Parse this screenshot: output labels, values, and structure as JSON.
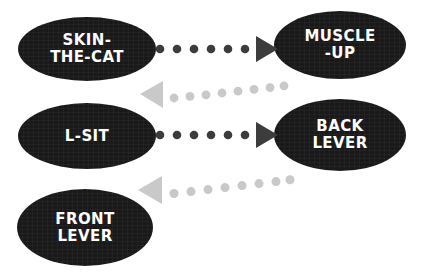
{
  "diagram": {
    "background_color": "#ffffff",
    "node_fill_color": "#191919",
    "node_text_color": "#ffffff",
    "arrow_dark_color": "#3c3c3c",
    "arrow_light_color": "#c9c9c9",
    "nodes": [
      {
        "id": "skin-the-cat",
        "label": "SKIN-\nTHE-CAT",
        "column": "left",
        "row": 1
      },
      {
        "id": "muscle-up",
        "label": "MUSCLE\n-UP",
        "column": "right",
        "row": 1
      },
      {
        "id": "l-sit",
        "label": "L-SIT",
        "column": "left",
        "row": 2
      },
      {
        "id": "back-lever",
        "label": "BACK\nLEVER",
        "column": "right",
        "row": 2
      },
      {
        "id": "front-lever",
        "label": "FRONT\nLEVER",
        "column": "left",
        "row": 3
      }
    ],
    "arrows": [
      {
        "id": "skin-to-muscle",
        "from": "skin-the-cat",
        "to": "muscle-up",
        "direction": "right",
        "style": "dotted",
        "color": "#3c3c3c",
        "dot_count": 6,
        "slope": "horizontal"
      },
      {
        "id": "muscle-to-lsit",
        "from": "muscle-up",
        "to": "l-sit",
        "direction": "left",
        "style": "dotted",
        "color": "#c9c9c9",
        "dot_count": 8,
        "slope": "up-right"
      },
      {
        "id": "lsit-to-back",
        "from": "l-sit",
        "to": "back-lever",
        "direction": "right",
        "style": "dotted",
        "color": "#3c3c3c",
        "dot_count": 6,
        "slope": "horizontal"
      },
      {
        "id": "back-to-front",
        "from": "back-lever",
        "to": "front-lever",
        "direction": "left",
        "style": "dotted",
        "color": "#c9c9c9",
        "dot_count": 8,
        "slope": "up-right"
      }
    ]
  }
}
